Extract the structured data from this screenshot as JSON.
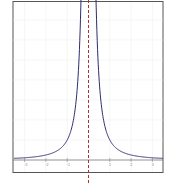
{
  "chart_data": {
    "type": "line",
    "title": "",
    "xlabel": "",
    "ylabel": "",
    "xlim": [
      -3.5,
      3.5
    ],
    "ylim": [
      -0.2,
      7
    ],
    "grid": true,
    "x_ticks": [
      -3,
      -2,
      -1,
      0,
      1,
      2,
      3
    ],
    "y_ticks": [
      1,
      2,
      3,
      4,
      5,
      6,
      7
    ],
    "asymptote": {
      "x": 0,
      "style": "dashed",
      "color": "#b03030"
    },
    "series": [
      {
        "name": "y = 1/x^2",
        "color": "#2c2c6e",
        "x": [
          -3.5,
          -3,
          -2.5,
          -2,
          -1.5,
          -1,
          -0.75,
          -0.5,
          -0.4,
          0.4,
          0.5,
          0.75,
          1,
          1.5,
          2,
          2.5,
          3,
          3.5
        ],
        "y": [
          0.08,
          0.11,
          0.16,
          0.25,
          0.44,
          1.0,
          1.78,
          4.0,
          6.25,
          6.25,
          4.0,
          1.78,
          1.0,
          0.44,
          0.25,
          0.16,
          0.11,
          0.08
        ]
      }
    ],
    "legend": null
  },
  "colors": {
    "frame": "#555555",
    "curve": "#2c2c6e",
    "asymptote": "#b03030",
    "axis": "#666666",
    "grid": "#f0f0f0"
  }
}
